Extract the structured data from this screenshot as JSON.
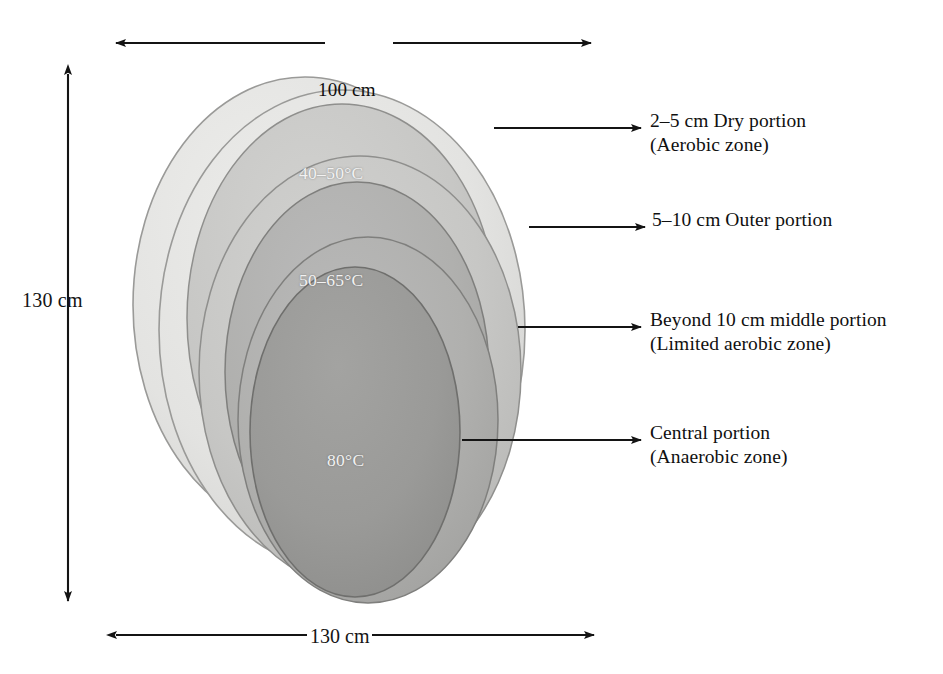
{
  "figure": {
    "type": "cross-section-diagram",
    "shape": "nested offset ellipses"
  },
  "dimensions": {
    "height_label": "130 cm",
    "width_label": "130 cm",
    "top_label": "100 cm"
  },
  "zones": [
    {
      "id": "outer-shell",
      "temp_label": "",
      "fill": "#e3e3e1",
      "stroke": "#9a9a98"
    },
    {
      "id": "outer-portion",
      "temp_label": "40–50°C",
      "fill": "#c7c7c5",
      "stroke": "#8f8f8d"
    },
    {
      "id": "middle-portion",
      "temp_label": "50–65°C",
      "fill": "#b0b0ae",
      "stroke": "#7f7f7d"
    },
    {
      "id": "central-portion",
      "temp_label": "80°C",
      "fill": "#9a9a98",
      "stroke": "#6f6f6d"
    }
  ],
  "callouts": [
    {
      "id": "dry-portion",
      "line1": "2–5 cm Dry portion",
      "line2": "(Aerobic zone)"
    },
    {
      "id": "outer-portion",
      "line1": "5–10 cm Outer portion",
      "line2": ""
    },
    {
      "id": "middle-portion",
      "line1": "Beyond 10 cm middle portion",
      "line2": "(Limited aerobic zone)"
    },
    {
      "id": "central-portion",
      "line1": "Central portion",
      "line2": "(Anaerobic zone)"
    }
  ],
  "colors": {
    "arrow": "#141414",
    "background": "#ffffff",
    "text": "#101010",
    "temp_text": "#f2f2f2"
  }
}
